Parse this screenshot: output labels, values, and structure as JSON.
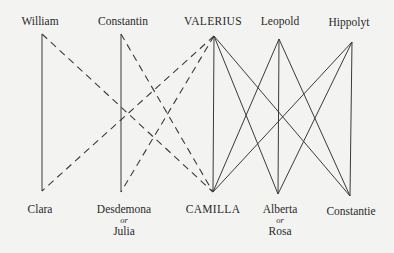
{
  "diagram": {
    "type": "character-relationship-diagram",
    "colors": {
      "background": "#f3f3f1",
      "ink": "#3a3a3a"
    },
    "top_row": [
      {
        "id": "william",
        "label": "William",
        "x": 42,
        "y": 34
      },
      {
        "id": "constantin",
        "label": "Constantin",
        "x": 121,
        "y": 34
      },
      {
        "id": "valerius",
        "label": "VALERIUS",
        "x": 214,
        "y": 36
      },
      {
        "id": "leopold",
        "label": "Leopold",
        "x": 279,
        "y": 39
      },
      {
        "id": "hippolyt",
        "label": "Hippolyt",
        "x": 352,
        "y": 42
      }
    ],
    "bottom_row": [
      {
        "id": "clara",
        "label": "Clara",
        "x": 42,
        "y": 191
      },
      {
        "id": "desdemona",
        "label": "Desdemona",
        "or": "or",
        "alt": "Julia",
        "x": 121,
        "y": 192
      },
      {
        "id": "camilla",
        "label": "CAMILLA",
        "x": 213,
        "y": 192
      },
      {
        "id": "alberta",
        "label": "Alberta",
        "or": "or",
        "alt": "Rosa",
        "x": 278,
        "y": 194
      },
      {
        "id": "constantie",
        "label": "Constantie",
        "x": 350,
        "y": 196
      }
    ],
    "edges": [
      {
        "from": "william",
        "to": "clara",
        "style": "solid"
      },
      {
        "from": "constantin",
        "to": "desdemona",
        "style": "solid"
      },
      {
        "from": "valerius",
        "to": "camilla",
        "style": "solid"
      },
      {
        "from": "valerius",
        "to": "alberta",
        "style": "solid"
      },
      {
        "from": "valerius",
        "to": "constantie",
        "style": "solid"
      },
      {
        "from": "leopold",
        "to": "camilla",
        "style": "solid"
      },
      {
        "from": "leopold",
        "to": "alberta",
        "style": "solid"
      },
      {
        "from": "leopold",
        "to": "constantie",
        "style": "solid"
      },
      {
        "from": "hippolyt",
        "to": "camilla",
        "style": "solid"
      },
      {
        "from": "hippolyt",
        "to": "alberta",
        "style": "solid"
      },
      {
        "from": "hippolyt",
        "to": "constantie",
        "style": "solid"
      },
      {
        "from": "william",
        "to": "camilla",
        "style": "dashed"
      },
      {
        "from": "constantin",
        "to": "camilla",
        "style": "dashed"
      },
      {
        "from": "valerius",
        "to": "clara",
        "style": "dashed"
      },
      {
        "from": "valerius",
        "to": "desdemona",
        "style": "dashed"
      }
    ]
  }
}
